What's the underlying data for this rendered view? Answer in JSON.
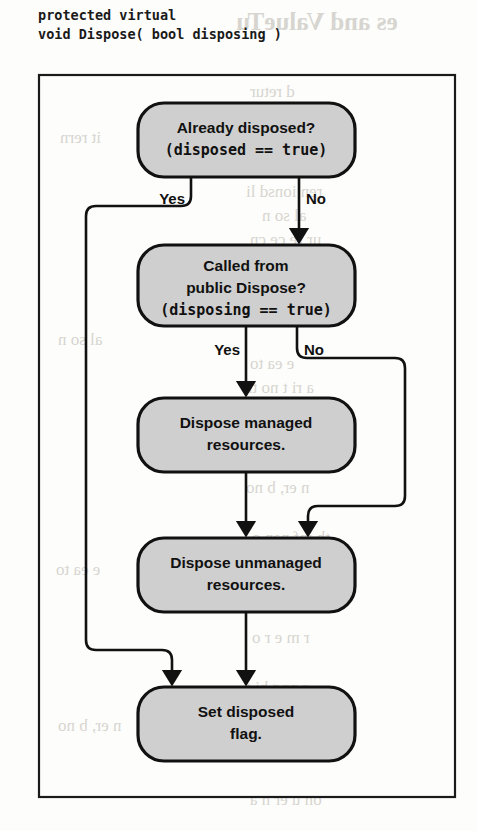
{
  "caption": {
    "line1": "protected virtual",
    "line2": "void Dispose( bool disposing )"
  },
  "diagram": {
    "colors": {
      "node_fill": "#cfcfcf",
      "stroke": "#111111",
      "frame": "#1a1a1a",
      "background": "#fdfdfb"
    },
    "nodes": [
      {
        "id": "already-disposed",
        "shape": "rounded-rect",
        "lines": [
          {
            "text": "Already disposed?",
            "font": "sans"
          },
          {
            "text": "(disposed == true)",
            "font": "mono"
          }
        ]
      },
      {
        "id": "called-from-public-dispose",
        "shape": "rounded-rect",
        "lines": [
          {
            "text": "Called from",
            "font": "sans"
          },
          {
            "text": "public Dispose?",
            "font": "sans"
          },
          {
            "text": "(disposing == true)",
            "font": "mono"
          }
        ]
      },
      {
        "id": "dispose-managed",
        "shape": "rounded-rect",
        "lines": [
          {
            "text": "Dispose managed",
            "font": "sans"
          },
          {
            "text": "resources.",
            "font": "sans"
          }
        ]
      },
      {
        "id": "dispose-unmanaged",
        "shape": "rounded-rect",
        "lines": [
          {
            "text": "Dispose unmanaged",
            "font": "sans"
          },
          {
            "text": "resources.",
            "font": "sans"
          }
        ]
      },
      {
        "id": "set-disposed-flag",
        "shape": "rounded-rect",
        "lines": [
          {
            "text": "Set disposed",
            "font": "sans"
          },
          {
            "text": "flag.",
            "font": "sans"
          }
        ]
      }
    ],
    "edge_labels": {
      "yes_1": "Yes",
      "no_1": "No",
      "yes_2": "Yes",
      "no_2": "No"
    },
    "edges": [
      {
        "from": "already-disposed",
        "to": "set-disposed-flag",
        "label": "Yes",
        "route": "left"
      },
      {
        "from": "already-disposed",
        "to": "called-from-public-dispose",
        "label": "No",
        "route": "down"
      },
      {
        "from": "called-from-public-dispose",
        "to": "dispose-managed",
        "label": "Yes",
        "route": "down"
      },
      {
        "from": "called-from-public-dispose",
        "to": "dispose-unmanaged",
        "label": "No",
        "route": "right"
      },
      {
        "from": "dispose-managed",
        "to": "dispose-unmanaged",
        "label": "",
        "route": "down"
      },
      {
        "from": "dispose-unmanaged",
        "to": "set-disposed-flag",
        "label": "",
        "route": "down"
      }
    ]
  },
  "bleed": {
    "l1": "es and ValueTu",
    "l2": "d  retur",
    "l3": "it rern",
    "l4": "e r. the",
    "l5": "ren  ionsd li",
    "l6": "al so n",
    "l7": "ur  re ce  cn",
    "l8": "fi gu e hen t",
    "l9": "he se   n   in",
    "l10": "i  on  r  tin",
    "l11": "e   ea  to",
    "l12": "a  ri t no th",
    "l13": "us  m ng  nt",
    "l14": "n  er, b  no",
    "l15": "th  inf  nan  o",
    "l16": "e   h n  ons",
    "l17": "r  m  e    r o",
    "l18": "c  nng  hi   t",
    "l19": "on  u  er   n a"
  }
}
